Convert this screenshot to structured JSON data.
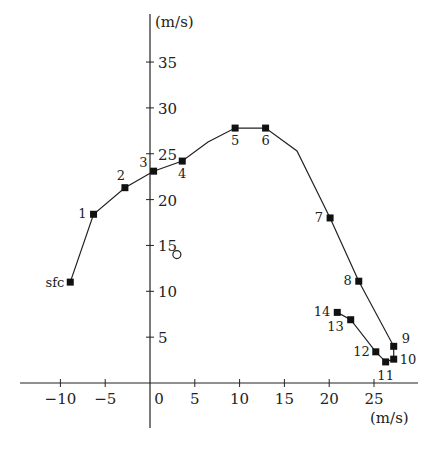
{
  "chart_data": {
    "type": "line",
    "title": "",
    "subtitle": "Hodograph",
    "xlabel": "(m/s)",
    "ylabel": "(m/s)",
    "xlim": [
      -14.5,
      30
    ],
    "ylim": [
      -5,
      40
    ],
    "grid": false,
    "legend": null,
    "x_ticks": [
      -10,
      -5,
      0,
      5,
      10,
      15,
      20,
      25
    ],
    "x_tick_labels": [
      "−10",
      "−5",
      "0",
      "5",
      "10",
      "15",
      "20",
      "25"
    ],
    "y_ticks": [
      5,
      10,
      15,
      20,
      25,
      30,
      35
    ],
    "y_tick_labels": [
      "5",
      "10",
      "15",
      "20",
      "25",
      "30",
      "35"
    ],
    "series": [
      {
        "name": "wind profile",
        "marker": "square",
        "points": [
          {
            "label": "sfc",
            "u": -8.9,
            "v": 11.0
          },
          {
            "label": "1",
            "u": -6.3,
            "v": 18.4
          },
          {
            "label": "2",
            "u": -2.8,
            "v": 21.3
          },
          {
            "label": "3",
            "u": 0.4,
            "v": 23.1
          },
          {
            "label": "4",
            "u": 3.6,
            "v": 24.2
          },
          {
            "label": "5",
            "u": 9.5,
            "v": 27.8
          },
          {
            "label": "6",
            "u": 12.9,
            "v": 27.8
          },
          {
            "label": "7",
            "u": 20.1,
            "v": 18.0
          },
          {
            "label": "8",
            "u": 23.3,
            "v": 11.1
          },
          {
            "label": "9",
            "u": 27.2,
            "v": 4.0
          },
          {
            "label": "10",
            "u": 27.2,
            "v": 2.6
          },
          {
            "label": "11",
            "u": 26.3,
            "v": 2.3
          },
          {
            "label": "12",
            "u": 25.2,
            "v": 3.4
          },
          {
            "label": "13",
            "u": 22.4,
            "v": 6.9
          },
          {
            "label": "14",
            "u": 20.9,
            "v": 7.7
          }
        ]
      }
    ],
    "annotations": [
      {
        "type": "open-circle",
        "u": 3.0,
        "v": 14.0,
        "note": "storm motion marker"
      }
    ]
  },
  "labels": {
    "y_unit": "(m/s)",
    "x_unit": "(m/s)"
  }
}
